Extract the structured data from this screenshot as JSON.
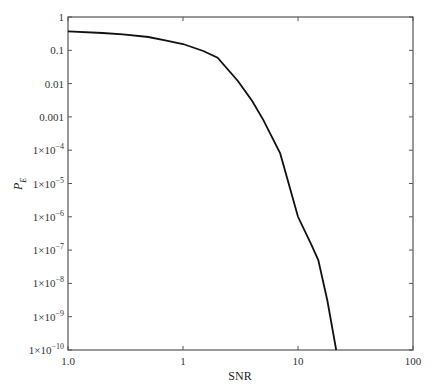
{
  "chart_data": {
    "type": "line",
    "title": "",
    "xlabel": "SNR",
    "ylabel": "P_E",
    "xscale": "log",
    "yscale": "log",
    "xlim": [
      0.1,
      100
    ],
    "ylim": [
      1e-10,
      1
    ],
    "grid": false,
    "legend": null,
    "x_ticks": [
      {
        "value": 0.1,
        "label": "1.0"
      },
      {
        "value": 1,
        "label": "1"
      },
      {
        "value": 10,
        "label": "10"
      },
      {
        "value": 100,
        "label": "100"
      }
    ],
    "y_ticks": [
      {
        "value": 1,
        "label": "1"
      },
      {
        "value": 0.1,
        "label": "0.1"
      },
      {
        "value": 0.01,
        "label": "0.01"
      },
      {
        "value": 0.001,
        "label": "0.001"
      },
      {
        "value": 0.0001,
        "label": "1×10",
        "exp": "−4"
      },
      {
        "value": 1e-05,
        "label": "1×10",
        "exp": "−5"
      },
      {
        "value": 1e-06,
        "label": "1×10",
        "exp": "−6"
      },
      {
        "value": 1e-07,
        "label": "1×10",
        "exp": "−7"
      },
      {
        "value": 1e-08,
        "label": "1×10",
        "exp": "−8"
      },
      {
        "value": 1e-09,
        "label": "1×10",
        "exp": "−9"
      },
      {
        "value": 1e-10,
        "label": "1×10",
        "exp": "−10"
      }
    ],
    "series": [
      {
        "name": "P_E vs SNR",
        "color": "#111111",
        "x": [
          0.1,
          0.2,
          0.3,
          0.5,
          0.7,
          1,
          1.5,
          2,
          3,
          4,
          5,
          7,
          10,
          13,
          15,
          18,
          21.5
        ],
        "y": [
          0.37,
          0.33,
          0.3,
          0.25,
          0.2,
          0.155,
          0.095,
          0.06,
          0.012,
          0.003,
          0.0008,
          8e-05,
          1e-06,
          1.5e-07,
          5e-08,
          3e-09,
          1e-10
        ]
      }
    ]
  },
  "labels": {
    "xlabel": "SNR",
    "ylabel_main": "P",
    "ylabel_sub": "E"
  }
}
